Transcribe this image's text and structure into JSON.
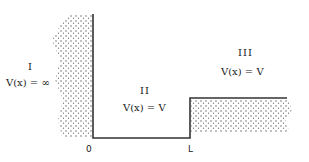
{
  "diagram": {
    "type": "potential-step-diagram",
    "regions": [
      {
        "id": "I",
        "numeral": "I",
        "equation": "V(x) = ∞"
      },
      {
        "id": "II",
        "numeral": "II",
        "equation": "V(x) = V"
      },
      {
        "id": "III",
        "numeral": "III",
        "equation": "V(x) = V"
      }
    ],
    "axis_labels": {
      "left": "0",
      "right": "L"
    },
    "colors": {
      "line": "#333333",
      "hatch": "#555555",
      "background": "#ffffff"
    }
  }
}
